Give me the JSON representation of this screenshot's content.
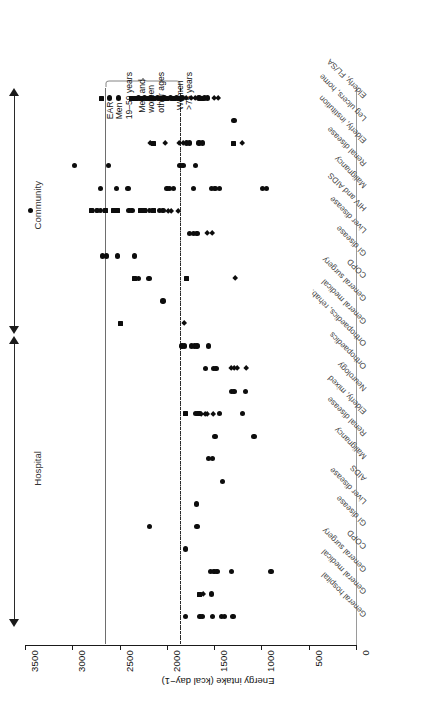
{
  "chart_data": {
    "type": "scatter",
    "title": "",
    "xlabel": "Energy intake (kcal day−1)",
    "ylabel": "",
    "orientation": "horizontal-dot-plot",
    "xlim": [
      0,
      3500
    ],
    "xticks": [
      3500,
      3000,
      2500,
      2000,
      1500,
      1000,
      500,
      0
    ],
    "xtick_labels": [
      "3500",
      "3000",
      "2500",
      "2000",
      "1500",
      "1000",
      "500",
      "0"
    ],
    "x_axis_reversed": true,
    "grid": false,
    "legend": null,
    "marker_shapes": [
      "circle",
      "square",
      "diamond"
    ],
    "reference_lines": [
      {
        "name": "EAR Men 19-59 years",
        "value": 2600,
        "style": "solid"
      },
      {
        "name": "Women >75 years",
        "value": 1810,
        "style": "dash-dot"
      }
    ],
    "annotations": [
      {
        "id": "ann-ear-men",
        "lines": [
          "EAR",
          "Men",
          "19–59 years"
        ]
      },
      {
        "id": "ann-men-women",
        "lines": [
          "Men and",
          "women",
          "other ages"
        ]
      },
      {
        "id": "ann-women75",
        "lines": [
          "Women",
          ">75 years"
        ]
      }
    ],
    "groups": [
      {
        "name": "Community",
        "categories": [
          "Elderly, FL/SA",
          "Leg ulcers, home",
          "Elderly, institution",
          "Renal disease",
          "Malignancy",
          "HIV and AIDS",
          "Liver disease",
          "GI disease",
          "COPD",
          "General surgery",
          "General medical"
        ]
      },
      {
        "name": "Hospital",
        "categories": [
          "Orthopaedics, rehab.",
          "Orthopaedics",
          "Neurology",
          "Elderly, mixed",
          "Renal disease",
          "Malignancy",
          "AIDS",
          "Liver disease",
          "GI disease",
          "COPD",
          "General surgery",
          "General medical",
          "General hospital"
        ]
      }
    ],
    "series": [
      {
        "category": "Elderly, FL/SA",
        "group": "Community",
        "points": [
          {
            "x": 2690,
            "m": "square"
          },
          {
            "x": 2610,
            "m": "circle"
          },
          {
            "x": 2510,
            "m": "circle"
          },
          {
            "x": 2370,
            "m": "square"
          },
          {
            "x": 2330,
            "m": "square"
          },
          {
            "x": 2300,
            "m": "circle"
          },
          {
            "x": 2270,
            "m": "square"
          },
          {
            "x": 2240,
            "m": "circle"
          },
          {
            "x": 2210,
            "m": "square"
          },
          {
            "x": 2170,
            "m": "circle"
          },
          {
            "x": 2140,
            "m": "square"
          },
          {
            "x": 2100,
            "m": "circle"
          },
          {
            "x": 2070,
            "m": "square"
          },
          {
            "x": 2030,
            "m": "circle"
          },
          {
            "x": 2000,
            "m": "square"
          },
          {
            "x": 1960,
            "m": "circle"
          },
          {
            "x": 1930,
            "m": "square"
          },
          {
            "x": 1900,
            "m": "circle"
          },
          {
            "x": 1870,
            "m": "square"
          },
          {
            "x": 1840,
            "m": "circle"
          },
          {
            "x": 1800,
            "m": "diamond"
          },
          {
            "x": 1740,
            "m": "diamond"
          },
          {
            "x": 1700,
            "m": "diamond"
          },
          {
            "x": 1660,
            "m": "circle"
          },
          {
            "x": 1630,
            "m": "square"
          },
          {
            "x": 1600,
            "m": "circle"
          },
          {
            "x": 1570,
            "m": "circle"
          },
          {
            "x": 1500,
            "m": "diamond"
          },
          {
            "x": 1460,
            "m": "diamond"
          }
        ]
      },
      {
        "category": "Leg ulcers, home",
        "group": "Community",
        "points": [
          {
            "x": 1290,
            "m": "circle"
          }
        ]
      },
      {
        "category": "Elderly, institution",
        "group": "Community",
        "points": [
          {
            "x": 2180,
            "m": "diamond"
          },
          {
            "x": 2140,
            "m": "square"
          },
          {
            "x": 2020,
            "m": "diamond"
          },
          {
            "x": 1870,
            "m": "diamond"
          },
          {
            "x": 1830,
            "m": "diamond"
          },
          {
            "x": 1790,
            "m": "circle"
          },
          {
            "x": 1760,
            "m": "circle"
          },
          {
            "x": 1660,
            "m": "circle"
          },
          {
            "x": 1620,
            "m": "circle"
          },
          {
            "x": 1300,
            "m": "square"
          },
          {
            "x": 1200,
            "m": "diamond"
          }
        ]
      },
      {
        "category": "Renal disease",
        "group": "Community",
        "points": [
          {
            "x": 2980,
            "m": "circle"
          },
          {
            "x": 2620,
            "m": "circle"
          },
          {
            "x": 1860,
            "m": "circle"
          },
          {
            "x": 1830,
            "m": "circle"
          },
          {
            "x": 1700,
            "m": "circle"
          }
        ]
      },
      {
        "category": "Malignancy",
        "group": "Community",
        "points": [
          {
            "x": 2700,
            "m": "circle"
          },
          {
            "x": 2530,
            "m": "circle"
          },
          {
            "x": 2410,
            "m": "circle"
          },
          {
            "x": 2000,
            "m": "circle"
          },
          {
            "x": 1970,
            "m": "circle"
          },
          {
            "x": 1930,
            "m": "circle"
          },
          {
            "x": 1720,
            "m": "circle"
          },
          {
            "x": 1530,
            "m": "circle"
          },
          {
            "x": 1490,
            "m": "circle"
          },
          {
            "x": 1440,
            "m": "circle"
          },
          {
            "x": 990,
            "m": "circle"
          },
          {
            "x": 950,
            "m": "circle"
          }
        ]
      },
      {
        "category": "HIV and AIDS",
        "group": "Community",
        "points": [
          {
            "x": 3440,
            "m": "circle"
          },
          {
            "x": 2800,
            "m": "square"
          },
          {
            "x": 2740,
            "m": "circle"
          },
          {
            "x": 2700,
            "m": "circle"
          },
          {
            "x": 2650,
            "m": "square"
          },
          {
            "x": 2560,
            "m": "square"
          },
          {
            "x": 2520,
            "m": "square"
          },
          {
            "x": 2400,
            "m": "circle"
          },
          {
            "x": 2370,
            "m": "circle"
          },
          {
            "x": 2280,
            "m": "square"
          },
          {
            "x": 2240,
            "m": "square"
          },
          {
            "x": 2180,
            "m": "circle"
          },
          {
            "x": 2140,
            "m": "square"
          },
          {
            "x": 2080,
            "m": "circle"
          },
          {
            "x": 2040,
            "m": "circle"
          },
          {
            "x": 1990,
            "m": "diamond"
          },
          {
            "x": 1950,
            "m": "diamond"
          },
          {
            "x": 1880,
            "m": "diamond"
          }
        ]
      },
      {
        "category": "Liver disease",
        "group": "Community",
        "points": [
          {
            "x": 1760,
            "m": "circle"
          },
          {
            "x": 1720,
            "m": "circle"
          },
          {
            "x": 1680,
            "m": "circle"
          },
          {
            "x": 1570,
            "m": "diamond"
          },
          {
            "x": 1520,
            "m": "diamond"
          }
        ]
      },
      {
        "category": "GI disease",
        "group": "Community",
        "points": [
          {
            "x": 2680,
            "m": "circle"
          },
          {
            "x": 2640,
            "m": "circle"
          },
          {
            "x": 2520,
            "m": "circle"
          },
          {
            "x": 2340,
            "m": "circle"
          }
        ]
      },
      {
        "category": "COPD",
        "group": "Community",
        "points": [
          {
            "x": 2340,
            "m": "square"
          },
          {
            "x": 2300,
            "m": "circle"
          },
          {
            "x": 2190,
            "m": "circle"
          },
          {
            "x": 1790,
            "m": "square"
          },
          {
            "x": 1280,
            "m": "diamond"
          }
        ]
      },
      {
        "category": "General surgery",
        "group": "Community",
        "points": [
          {
            "x": 2040,
            "m": "circle"
          }
        ]
      },
      {
        "category": "General medical",
        "group": "Community",
        "points": [
          {
            "x": 2490,
            "m": "square"
          },
          {
            "x": 1820,
            "m": "diamond"
          }
        ]
      },
      {
        "category": "Orthopaedics, rehab.",
        "group": "Hospital",
        "points": [
          {
            "x": 1840,
            "m": "circle"
          },
          {
            "x": 1810,
            "m": "circle"
          },
          {
            "x": 1740,
            "m": "circle"
          },
          {
            "x": 1710,
            "m": "circle"
          },
          {
            "x": 1680,
            "m": "circle"
          },
          {
            "x": 1560,
            "m": "circle"
          }
        ]
      },
      {
        "category": "Orthopaedics",
        "group": "Hospital",
        "points": [
          {
            "x": 1590,
            "m": "circle"
          },
          {
            "x": 1510,
            "m": "circle"
          },
          {
            "x": 1480,
            "m": "circle"
          },
          {
            "x": 1320,
            "m": "diamond"
          },
          {
            "x": 1290,
            "m": "diamond"
          },
          {
            "x": 1260,
            "m": "diamond"
          },
          {
            "x": 1160,
            "m": "diamond"
          }
        ]
      },
      {
        "category": "Neurology",
        "group": "Hospital",
        "points": [
          {
            "x": 1320,
            "m": "circle"
          },
          {
            "x": 1290,
            "m": "circle"
          },
          {
            "x": 1170,
            "m": "circle"
          }
        ]
      },
      {
        "category": "Elderly, mixed",
        "group": "Hospital",
        "points": [
          {
            "x": 1800,
            "m": "square"
          },
          {
            "x": 1700,
            "m": "circle"
          },
          {
            "x": 1670,
            "m": "square"
          },
          {
            "x": 1640,
            "m": "diamond"
          },
          {
            "x": 1600,
            "m": "diamond"
          },
          {
            "x": 1570,
            "m": "diamond"
          },
          {
            "x": 1510,
            "m": "diamond"
          },
          {
            "x": 1440,
            "m": "circle"
          },
          {
            "x": 1200,
            "m": "circle"
          }
        ]
      },
      {
        "category": "Renal disease",
        "group": "Hospital",
        "points": [
          {
            "x": 1490,
            "m": "circle"
          },
          {
            "x": 1080,
            "m": "circle"
          }
        ]
      },
      {
        "category": "Malignancy",
        "group": "Hospital",
        "points": [
          {
            "x": 1560,
            "m": "circle"
          },
          {
            "x": 1520,
            "m": "circle"
          }
        ]
      },
      {
        "category": "AIDS",
        "group": "Hospital",
        "points": [
          {
            "x": 1410,
            "m": "circle"
          }
        ]
      },
      {
        "category": "Liver disease",
        "group": "Hospital",
        "points": [
          {
            "x": 1690,
            "m": "circle"
          }
        ]
      },
      {
        "category": "GI disease",
        "group": "Hospital",
        "points": [
          {
            "x": 2180,
            "m": "circle"
          },
          {
            "x": 1680,
            "m": "circle"
          }
        ]
      },
      {
        "category": "COPD",
        "group": "Hospital",
        "points": [
          {
            "x": 1800,
            "m": "circle"
          }
        ]
      },
      {
        "category": "General surgery",
        "group": "Hospital",
        "points": [
          {
            "x": 1540,
            "m": "circle"
          },
          {
            "x": 1500,
            "m": "circle"
          },
          {
            "x": 1470,
            "m": "circle"
          },
          {
            "x": 1320,
            "m": "circle"
          },
          {
            "x": 900,
            "m": "circle"
          }
        ]
      },
      {
        "category": "General medical",
        "group": "Hospital",
        "points": [
          {
            "x": 1660,
            "m": "square"
          },
          {
            "x": 1620,
            "m": "diamond"
          },
          {
            "x": 1530,
            "m": "circle"
          }
        ]
      },
      {
        "category": "General hospital",
        "group": "Hospital",
        "points": [
          {
            "x": 1800,
            "m": "circle"
          },
          {
            "x": 1650,
            "m": "circle"
          },
          {
            "x": 1620,
            "m": "circle"
          },
          {
            "x": 1520,
            "m": "circle"
          },
          {
            "x": 1420,
            "m": "circle"
          },
          {
            "x": 1390,
            "m": "circle"
          },
          {
            "x": 1300,
            "m": "circle"
          }
        ]
      }
    ]
  }
}
